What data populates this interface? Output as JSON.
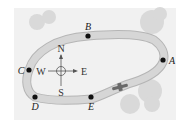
{
  "diagram": {
    "type": "track-map",
    "colors": {
      "background": "#ffffff",
      "panel": "#f1f1f1",
      "track_fill": "#d6d6d6",
      "track_edge": "#b5b5b5",
      "trees": "#d9d9d9",
      "points": "#111111",
      "vehicle": "#6a6a6a"
    },
    "points": [
      {
        "label": "A",
        "x": 163,
        "y": 60
      },
      {
        "label": "B",
        "x": 88,
        "y": 36
      },
      {
        "label": "C",
        "x": 29,
        "y": 70
      },
      {
        "label": "D",
        "x": 35,
        "y": 97
      },
      {
        "label": "E",
        "x": 91,
        "y": 97
      }
    ],
    "compass": {
      "north": "N",
      "south": "S",
      "east": "E",
      "west": "W",
      "center": {
        "x": 61,
        "y": 71
      }
    },
    "vehicle": {
      "name": "car-icon",
      "x": 120,
      "y": 87
    }
  }
}
